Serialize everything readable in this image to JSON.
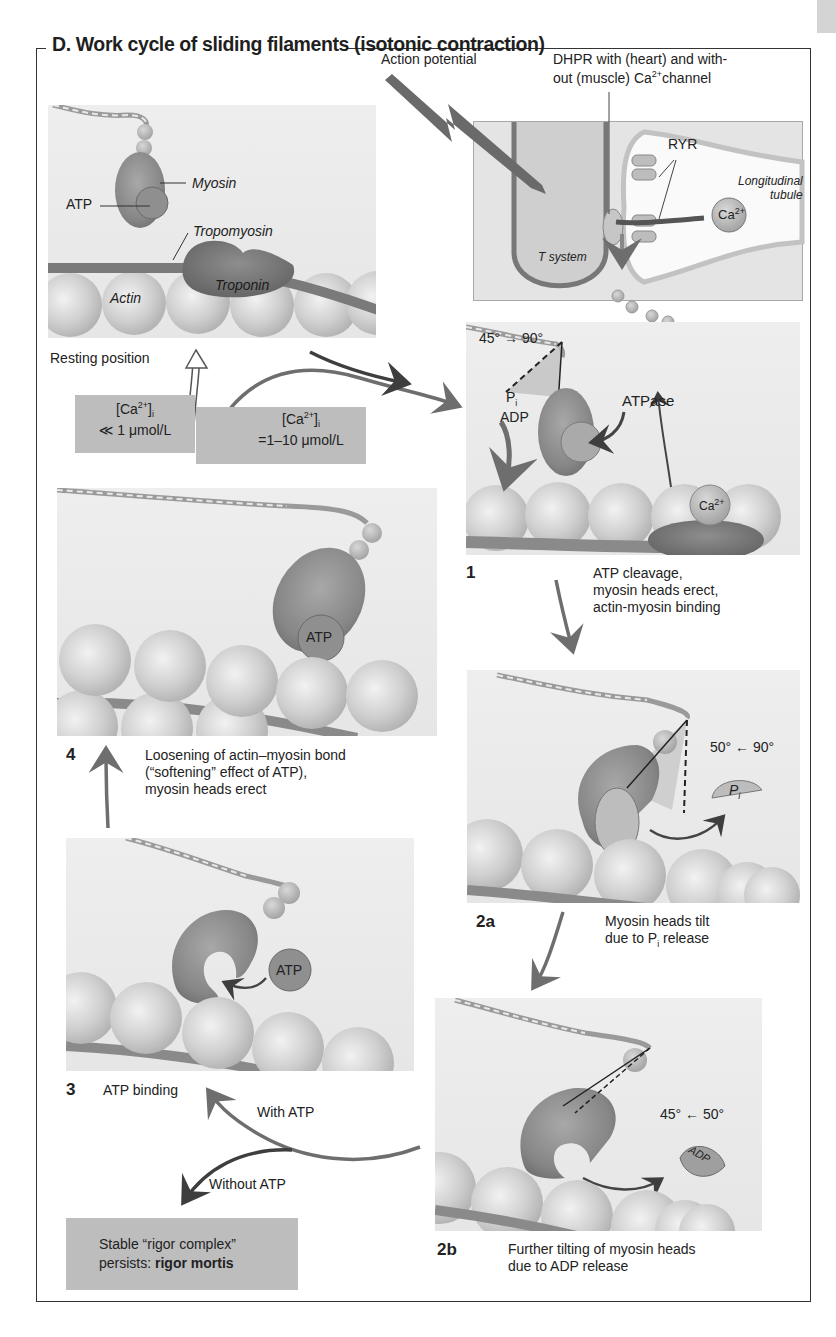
{
  "title": "D.  Work cycle of sliding filaments (isotonic contraction)",
  "colors": {
    "frame": "#333333",
    "panel_bg": "#e9e9e9",
    "gray_box": "#bdbdbd",
    "myosin": "#8a8a8a",
    "actin": "#c9c9c9",
    "arrow": "#6e6e6e",
    "arrow_dark": "#444444"
  },
  "top_right": {
    "action_potential": "Action potential",
    "dhpr_line1": "DHPR with (heart) and with-",
    "dhpr_line2": "out (muscle) Ca",
    "dhpr_sup": "2+",
    "dhpr_line2_end": "channel",
    "ryr": "RYR",
    "longitudinal": "Longitudinal",
    "tubule": "tubule",
    "t_system": "T system",
    "ca": "Ca",
    "ca_sup": "2+"
  },
  "resting": {
    "myosin": "Myosin",
    "atp": "ATP",
    "tropomyosin": "Tropomyosin",
    "troponin": "Troponin",
    "actin": "Actin",
    "caption": "Resting position"
  },
  "calcium": {
    "low_line1": "[Ca",
    "low_sup": "2+",
    "low_sub": "i",
    "low_line2": "≪ 1 μmol/L",
    "high_line1": "[Ca",
    "high_sup": "2+",
    "high_sub": "i",
    "high_line2": "=1–10 μmol/L"
  },
  "step1": {
    "number": "1",
    "angle": "45° → 90°",
    "pi": "P",
    "pi_sub": "i",
    "adp": "ADP",
    "atpase": "ATPase",
    "ca": "Ca",
    "ca_sup": "2+",
    "caption_line1": "ATP cleavage,",
    "caption_line2": "myosin heads erect,",
    "caption_line3": "actin-myosin binding"
  },
  "step4": {
    "number": "4",
    "atp": "ATP",
    "caption_line1": "Loosening of actin–myosin bond",
    "caption_line2": "(“softening” effect of ATP),",
    "caption_line3": "myosin heads erect"
  },
  "step2a": {
    "number": "2a",
    "angle": "50° ← 90°",
    "pi": "P",
    "pi_sub": "i",
    "caption_line1": "Myosin heads tilt",
    "caption_line2_a": "due to P",
    "caption_line2_sub": "i",
    "caption_line2_b": " release"
  },
  "step3": {
    "number": "3",
    "atp": "ATP",
    "caption": "ATP binding",
    "with_atp": "With ATP",
    "without_atp": "Without ATP"
  },
  "step2b": {
    "number": "2b",
    "angle": "45° ← 50°",
    "adp": "ADP",
    "caption_line1": "Further tilting of myosin heads",
    "caption_line2": "due to ADP release"
  },
  "rigor": {
    "line1": "Stable “rigor complex”",
    "line2_a": "persists: ",
    "line2_bold": "rigor mortis"
  }
}
